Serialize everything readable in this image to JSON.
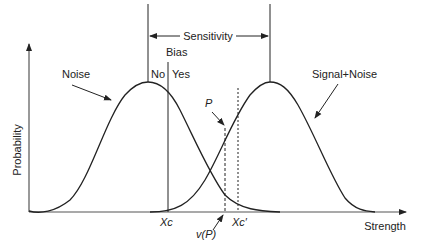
{
  "diagram": {
    "axes": {
      "y_label": "Probability",
      "x_label": "Strength"
    },
    "curves": [
      {
        "name": "Noise",
        "label": "Noise",
        "peak_x": 148
      },
      {
        "name": "Signal+Noise",
        "label": "Signal+Noise",
        "peak_x": 270
      }
    ],
    "annotations": {
      "sensitivity": "Sensitivity",
      "bias": "Bias",
      "no": "No",
      "yes": "Yes",
      "p": "P",
      "xc": "Xc",
      "xc_prime": "Xc′",
      "v_p": "v(P)"
    },
    "colors": {
      "line": "#222222",
      "background": "#ffffff"
    }
  }
}
